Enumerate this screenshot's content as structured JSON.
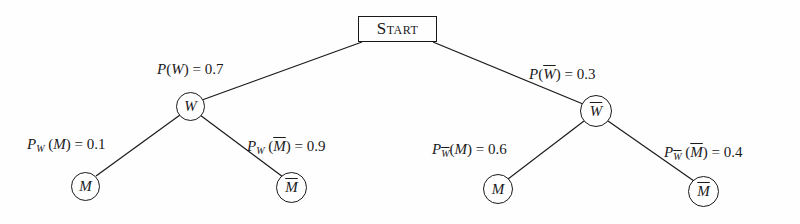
{
  "diagram": {
    "type": "probability-tree",
    "root": {
      "label": "Start"
    },
    "level1": [
      {
        "id": "W",
        "node_label": "W",
        "overline": false,
        "edge_label": {
          "prefix": "P",
          "sub": "",
          "event": "W",
          "event_overline": false,
          "value": "0.7"
        }
      },
      {
        "id": "notW",
        "node_label": "W",
        "overline": true,
        "edge_label": {
          "prefix": "P",
          "sub": "",
          "event": "W",
          "event_overline": true,
          "value": "0.3"
        }
      }
    ],
    "level2": [
      {
        "parent": "W",
        "node_label": "M",
        "overline": false,
        "edge_label": {
          "prefix": "P",
          "sub": "W",
          "sub_overline": false,
          "event": "M",
          "event_overline": false,
          "value": "0.1"
        }
      },
      {
        "parent": "W",
        "node_label": "M",
        "overline": true,
        "edge_label": {
          "prefix": "P",
          "sub": "W",
          "sub_overline": false,
          "event": "M",
          "event_overline": true,
          "value": "0.9"
        }
      },
      {
        "parent": "notW",
        "node_label": "M",
        "overline": false,
        "edge_label": {
          "prefix": "P",
          "sub": "W",
          "sub_overline": true,
          "event": "M",
          "event_overline": false,
          "value": "0.6"
        }
      },
      {
        "parent": "notW",
        "node_label": "M",
        "overline": true,
        "edge_label": {
          "prefix": "P",
          "sub": "W",
          "sub_overline": true,
          "event": "M",
          "event_overline": true,
          "value": "0.4"
        }
      }
    ],
    "symbols": {
      "eq": " = ",
      "lparen": "(",
      "rparen": ")"
    }
  }
}
